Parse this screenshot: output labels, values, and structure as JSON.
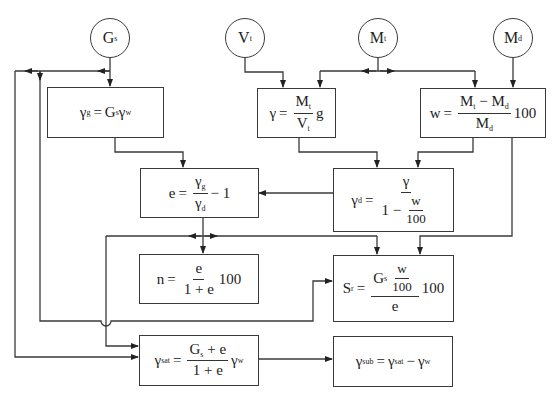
{
  "diagram": {
    "inputs": [
      {
        "id": "Gs",
        "base": "G",
        "sub": "s"
      },
      {
        "id": "Vt",
        "base": "V",
        "sub": "t"
      },
      {
        "id": "Mt",
        "base": "M",
        "sub": "t"
      },
      {
        "id": "Md",
        "base": "M",
        "sub": "d"
      }
    ],
    "boxes": {
      "gamma_g": {
        "lhs": "γ",
        "lhs_sub": "g",
        "eq": "=",
        "rhs_a": "G",
        "rhs_a_sub": "s",
        "rhs_b": "γ",
        "rhs_b_sub": "w"
      },
      "gamma": {
        "lhs": "γ",
        "eq": "=",
        "num": "M",
        "num_sub": "t",
        "den": "V",
        "den_sub": "t",
        "tail": "g"
      },
      "w": {
        "lhs": "w",
        "eq": "=",
        "num_a": "M",
        "num_a_sub": "t",
        "num_op": "−",
        "num_b": "M",
        "num_b_sub": "d",
        "den": "M",
        "den_sub": "d",
        "tail": "100"
      },
      "e": {
        "lhs": "e",
        "eq": "=",
        "num": "γ",
        "num_sub": "g",
        "den": "γ",
        "den_sub": "d",
        "tail": "− 1"
      },
      "gamma_d": {
        "lhs": "γ",
        "lhs_sub": "d",
        "eq": "=",
        "num": "γ",
        "den_a": "1 −",
        "den_num": "w",
        "den_den": "100"
      },
      "n": {
        "lhs": "n",
        "eq": "=",
        "num": "e",
        "den": "1 + e",
        "tail": "100"
      },
      "Sr": {
        "lhs": "S",
        "lhs_sub": "r",
        "eq": "=",
        "num_a": "G",
        "num_a_sub": "s",
        "num_num": "w",
        "num_den": "100",
        "den": "e",
        "tail": "100"
      },
      "gamma_sat": {
        "lhs": "γ",
        "lhs_sub": "sat",
        "eq": "=",
        "num_a": "G",
        "num_a_sub": "s",
        "num_b": "+ e",
        "den": "1 + e",
        "tail": "γ",
        "tail_sub": "w"
      },
      "gamma_sub": {
        "lhs": "γ",
        "lhs_sub": "sub",
        "eq": "=",
        "a": "γ",
        "a_sub": "sat",
        "op": "−",
        "b": "γ",
        "b_sub": "w"
      }
    },
    "colors": {
      "line": "#3a3a3a",
      "background": "#ffffff"
    }
  }
}
